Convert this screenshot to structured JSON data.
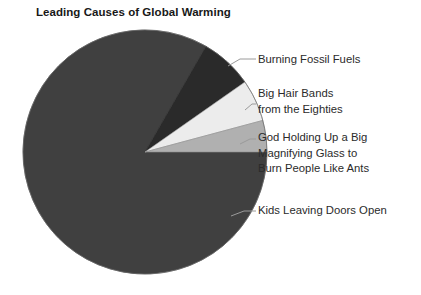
{
  "chart_data": {
    "type": "pie",
    "title": "Leading Causes of Global Warming",
    "subtitle": "",
    "xlabel": "",
    "ylabel": "",
    "grid": false,
    "legend_position": "callout-labels-right",
    "labels": [
      "Burning Fossil Fuels",
      "Big Hair Bands from the Eighties",
      "God Holding Up a Big Magnifying Glass to Burn People Like Ants",
      "Kids Leaving Doors Open"
    ],
    "values": [
      7,
      5.5,
      4.5,
      83
    ],
    "slices": [
      {
        "label": "Burning Fossil Fuels",
        "value": 7,
        "percent": "7%",
        "color": "#2a2a2a",
        "start_angle_deg": 300,
        "end_angle_deg": 325
      },
      {
        "label": "Big Hair Bands from the Eighties",
        "value": 5.5,
        "percent": "5.5%",
        "color": "#ececec",
        "start_angle_deg": 325,
        "end_angle_deg": 345
      },
      {
        "label": "God Holding Up a Big Magnifying Glass to Burn People Like Ants",
        "value": 4.5,
        "percent": "4.5%",
        "color": "#b0b0b0",
        "start_angle_deg": 345,
        "end_angle_deg": 360
      },
      {
        "label": "Kids Leaving Doors Open",
        "value": 83,
        "percent": "83%",
        "color": "#404040",
        "start_angle_deg": 0,
        "end_angle_deg": 300
      }
    ]
  },
  "chart": {
    "title": "Leading Causes of Global Warming"
  },
  "labels": {
    "burning_fossil_fuels": "Burning Fossil Fuels",
    "big_hair_bands_line1": "Big Hair Bands",
    "big_hair_bands_line2": "from the Eighties",
    "god_holding_line1": "God Holding Up a Big",
    "god_holding_line2": "Magnifying Glass to",
    "god_holding_line3": "Burn People Like Ants",
    "kids_leaving_doors_open": "Kids Leaving Doors Open"
  },
  "colors": {
    "slice_burning_fossil_fuels": "#2a2a2a",
    "slice_big_hair_bands": "#ececec",
    "slice_god_holding": "#b0b0b0",
    "slice_kids_leaving": "#404040",
    "leader_line": "#9a9a9a",
    "background": "#ffffff",
    "text": "#2b2b2b",
    "title_text": "#181818"
  }
}
